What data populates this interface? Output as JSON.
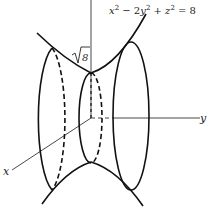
{
  "figure": {
    "equation": {
      "x_term": "x",
      "x_exp": "2",
      "minus": " − 2",
      "y_term": "y",
      "y_exp": "2",
      "plus": " + ",
      "z_term": "z",
      "z_exp": "2",
      "rhs": " = 8"
    },
    "radius_label": "8",
    "axis_labels": {
      "x": "x",
      "y": "y"
    },
    "colors": {
      "stroke": "#111111",
      "axis": "#333333",
      "background": "#ffffff"
    }
  }
}
